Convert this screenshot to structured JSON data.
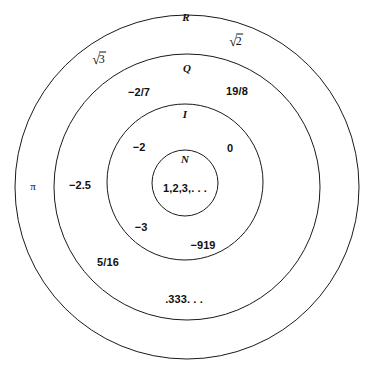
{
  "diagram": {
    "background_color": "#ffffff",
    "stroke_color": "#1a1a1a",
    "text_color": "#111111",
    "sets": [
      {
        "name": "set-R",
        "label": "R",
        "center_x": 187,
        "center_y": 187,
        "radius": 172
      },
      {
        "name": "set-Q",
        "label": "Q",
        "center_x": 187,
        "center_y": 187,
        "radius": 133
      },
      {
        "name": "set-I",
        "label": "I",
        "center_x": 185,
        "center_y": 182,
        "radius": 78
      },
      {
        "name": "set-N",
        "label": "N",
        "center_x": 185,
        "center_y": 183,
        "radius": 33
      }
    ],
    "set_name_positions": {
      "R": {
        "x": 186,
        "y": 17
      },
      "Q": {
        "x": 187,
        "y": 68
      },
      "I": {
        "x": 185,
        "y": 114
      },
      "N": {
        "x": 185,
        "y": 159
      }
    },
    "members": [
      {
        "name": "member-sqrt3",
        "text": "√3",
        "kind": "radical",
        "arg": "3",
        "set": "R",
        "x": 99,
        "y": 58
      },
      {
        "name": "member-sqrt2",
        "text": "√2",
        "kind": "radical",
        "arg": "2",
        "set": "R",
        "x": 236,
        "y": 40
      },
      {
        "name": "member-pi",
        "text": "π",
        "kind": "pi",
        "set": "R",
        "x": 33,
        "y": 186
      },
      {
        "name": "member-neg-2-7",
        "text": "−2/7",
        "kind": "value",
        "set": "Q",
        "x": 139,
        "y": 92
      },
      {
        "name": "member-19-8",
        "text": "19/8",
        "kind": "value",
        "set": "Q",
        "x": 237,
        "y": 91
      },
      {
        "name": "member-neg-2-5",
        "text": "−2.5",
        "kind": "value",
        "set": "Q",
        "x": 80,
        "y": 185
      },
      {
        "name": "member-5-16",
        "text": "5/16",
        "kind": "value",
        "set": "Q",
        "x": 108,
        "y": 262
      },
      {
        "name": "member-point-333",
        "text": ".333. . .",
        "kind": "value",
        "set": "Q",
        "x": 184,
        "y": 299
      },
      {
        "name": "member-neg-2",
        "text": "−2",
        "kind": "value",
        "set": "I",
        "x": 139,
        "y": 147
      },
      {
        "name": "member-0",
        "text": "0",
        "kind": "value",
        "set": "I",
        "x": 230,
        "y": 148
      },
      {
        "name": "member-neg-3",
        "text": "−3",
        "kind": "value",
        "set": "I",
        "x": 141,
        "y": 227
      },
      {
        "name": "member-neg-919",
        "text": "−919",
        "kind": "value",
        "set": "I",
        "x": 203,
        "y": 245
      },
      {
        "name": "member-naturals",
        "text": "1,2,3,. . .",
        "kind": "value",
        "set": "N",
        "x": 185,
        "y": 188
      }
    ]
  }
}
